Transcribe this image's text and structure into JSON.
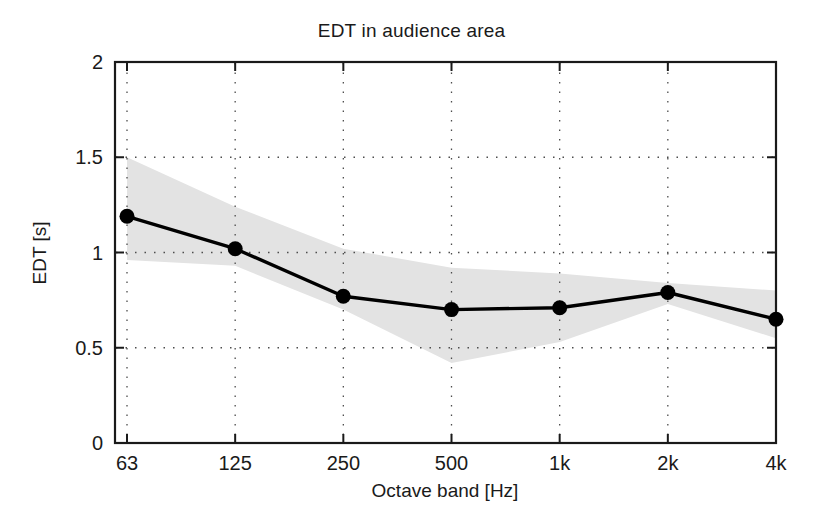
{
  "chart_data": {
    "type": "line",
    "title": "EDT in audience area",
    "xlabel": "Octave band [Hz]",
    "ylabel": "EDT [s]",
    "categories": [
      "63",
      "125",
      "250",
      "500",
      "1k",
      "2k",
      "4k"
    ],
    "values": [
      1.19,
      1.02,
      0.77,
      0.7,
      0.71,
      0.79,
      0.65
    ],
    "series": [
      {
        "name": "EDT mean",
        "values": [
          1.19,
          1.02,
          0.77,
          0.7,
          0.71,
          0.79,
          0.65
        ],
        "marker": "filled-circle",
        "color": "#000000"
      },
      {
        "name": "EDT spread band (upper)",
        "values": [
          1.5,
          1.24,
          1.02,
          0.92,
          0.89,
          0.84,
          0.8
        ],
        "color": "#e0e0e0"
      },
      {
        "name": "EDT spread band (lower)",
        "values": [
          0.96,
          0.93,
          0.7,
          0.42,
          0.53,
          0.73,
          0.55
        ],
        "color": "#e0e0e0"
      }
    ],
    "ylim": [
      0,
      2
    ],
    "yticks": [
      "0",
      "0.5",
      "1",
      "1.5",
      "2"
    ],
    "ytick_values": [
      0,
      0.5,
      1,
      1.5,
      2
    ],
    "xticks": [
      "63",
      "125",
      "250",
      "500",
      "1k",
      "2k",
      "4k"
    ],
    "grid": "dotted",
    "legend": "none",
    "band_color": "#e3e3e3",
    "line_color": "#000000",
    "axis_color": "#1a1a1a"
  }
}
